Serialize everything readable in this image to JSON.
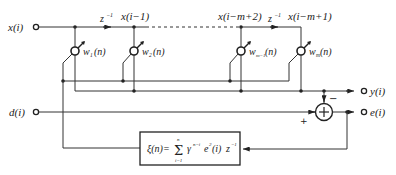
{
  "diagram": {
    "inputs": {
      "x": "x(i)",
      "d": "d(i)"
    },
    "outputs": {
      "y": "y(i)",
      "e": "e(i)"
    },
    "delay_label": "z",
    "delay_exp": "−1",
    "taps": [
      {
        "signal": "x(i−1)"
      },
      {
        "signal": "x(i−m+2)"
      },
      {
        "signal": "x(i−m+1)"
      }
    ],
    "weights": [
      {
        "name": "w",
        "sub": "1",
        "arg": "(n)"
      },
      {
        "name": "w",
        "sub": "2",
        "arg": "(n)"
      },
      {
        "name": "w",
        "sub": "m−1",
        "arg": "(n)"
      },
      {
        "name": "w",
        "sub": "m",
        "arg": "(n)"
      }
    ],
    "summer": {
      "plus_sign": "+",
      "minus_sign": "−"
    },
    "cost_block": {
      "lhs": "ξ(n)=",
      "sum_upper": "n",
      "sum_lower": "i=1",
      "gamma": "γ",
      "gamma_exp": "n−i",
      "e": "e",
      "e_exp": "2",
      "e_arg": "(i)",
      "z": "z",
      "z_exp": "−1"
    }
  }
}
